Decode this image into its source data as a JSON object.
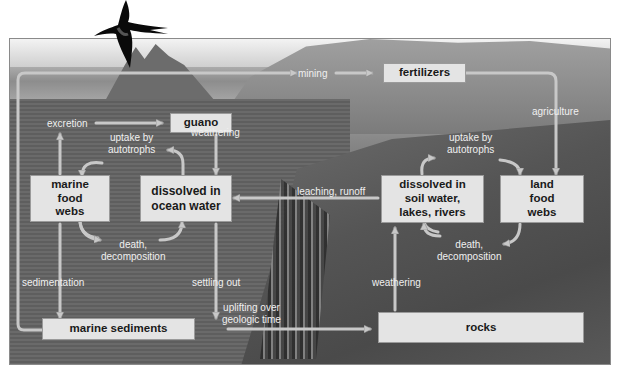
{
  "diagram": {
    "style": {
      "box_fill": "#e4e4e4",
      "box_border": "#9a9a9a",
      "arrow_color": "#c8c8c8",
      "label_color": "#f0f0f0",
      "box_text_color": "#1a1a1a"
    },
    "nodes": {
      "guano": "guano",
      "fertilizers": "fertilizers",
      "marine_food_webs": "marine food webs",
      "dissolved_ocean": "dissolved in ocean water",
      "dissolved_soil": "dissolved in soil water, lakes, rivers",
      "land_food_webs": "land food webs",
      "marine_sediments": "marine sediments",
      "rocks": "rocks"
    },
    "node_lines": {
      "marine_food_webs": [
        "marine",
        "food",
        "webs"
      ],
      "dissolved_ocean": [
        "dissolved in",
        "ocean water"
      ],
      "dissolved_soil": [
        "dissolved in",
        "soil water,",
        "lakes, rivers"
      ],
      "land_food_webs": [
        "land",
        "food",
        "webs"
      ]
    },
    "edge_labels": {
      "mining": "mining",
      "excretion": "excretion",
      "weathering_guano": "weathering",
      "agriculture": "agriculture",
      "uptake_marine": [
        "uptake by",
        "autotrophs"
      ],
      "uptake_land": [
        "uptake by",
        "autotrophs"
      ],
      "leaching": "leaching, runoff",
      "death_marine": [
        "death,",
        "decomposition"
      ],
      "death_land": [
        "death,",
        "decomposition"
      ],
      "sedimentation": "sedimentation",
      "settling": "settling out",
      "weathering_rocks": "weathering",
      "uplifting": [
        "uplifting over",
        "geologic time"
      ]
    },
    "edges": [
      {
        "from": "marine_sediments",
        "to": "fertilizers",
        "label": "mining"
      },
      {
        "from": "marine_food_webs",
        "to": "guano",
        "label": "excretion"
      },
      {
        "from": "guano",
        "to": "dissolved_ocean",
        "label": "weathering"
      },
      {
        "from": "fertilizers",
        "to": "land_food_webs",
        "label": "agriculture"
      },
      {
        "from": "dissolved_ocean",
        "to": "marine_food_webs",
        "label": "uptake by autotrophs"
      },
      {
        "from": "marine_food_webs",
        "to": "dissolved_ocean",
        "label": "death, decomposition"
      },
      {
        "from": "dissolved_soil",
        "to": "land_food_webs",
        "label": "uptake by autotrophs"
      },
      {
        "from": "land_food_webs",
        "to": "dissolved_soil",
        "label": "death, decomposition"
      },
      {
        "from": "dissolved_soil",
        "to": "dissolved_ocean",
        "label": "leaching, runoff"
      },
      {
        "from": "marine_food_webs",
        "to": "marine_sediments",
        "label": "sedimentation"
      },
      {
        "from": "dissolved_ocean",
        "to": "marine_sediments",
        "label": "settling out"
      },
      {
        "from": "rocks",
        "to": "dissolved_soil",
        "label": "weathering"
      },
      {
        "from": "marine_sediments",
        "to": "rocks",
        "label": "uplifting over geologic time"
      }
    ]
  }
}
